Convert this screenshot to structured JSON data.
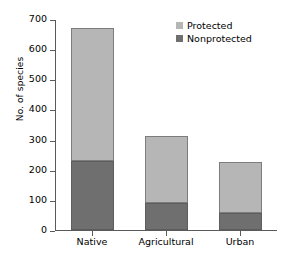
{
  "chart_data": {
    "type": "bar",
    "stacked": true,
    "title": "",
    "xlabel": "",
    "ylabel": "No. of species",
    "categories": [
      "Native",
      "Agricultural",
      "Urban"
    ],
    "series": [
      {
        "name": "Nonprotected",
        "color": "#6f6f6f",
        "values": [
          230,
          88,
          55
        ]
      },
      {
        "name": "Protected",
        "color": "#b6b6b6",
        "values": [
          440,
          224,
          170
        ]
      }
    ],
    "totals": [
      670,
      312,
      225
    ],
    "ylim": [
      0,
      700
    ],
    "ytick_labels": [
      "0",
      "100",
      "200",
      "300",
      "400",
      "500",
      "600",
      "700"
    ],
    "ytick_values": [
      0,
      100,
      200,
      300,
      400,
      500,
      600,
      700
    ],
    "grid": false,
    "legend_position": "top-right",
    "legend_entries": [
      {
        "label": "Protected",
        "color": "#b6b6b6"
      },
      {
        "label": "Nonprotected",
        "color": "#6f6f6f"
      }
    ]
  }
}
